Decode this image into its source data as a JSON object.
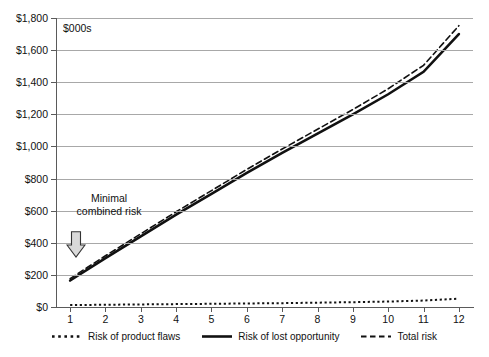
{
  "chart_data": {
    "type": "line",
    "title": "",
    "units_note": "$000s",
    "xlabel": "",
    "ylabel": "",
    "x": [
      1,
      2,
      3,
      4,
      5,
      6,
      7,
      8,
      9,
      10,
      11,
      12
    ],
    "xlim": [
      0.6,
      12.4
    ],
    "ylim": [
      0,
      1800
    ],
    "ytick_values": [
      0,
      200,
      400,
      600,
      800,
      1000,
      1200,
      1400,
      1600,
      1800
    ],
    "ytick_labels": [
      "$0",
      "$200",
      "$400",
      "$600",
      "$800",
      "$1,000",
      "$1,200",
      "$1,400",
      "$1,600",
      "$1,800"
    ],
    "xtick_labels": [
      "1",
      "2",
      "3",
      "4",
      "5",
      "6",
      "7",
      "8",
      "9",
      "10",
      "11",
      "12"
    ],
    "grid": true,
    "legend_position": "bottom",
    "series": [
      {
        "name": "Risk of product flaws",
        "style": "dotted",
        "color": "#111111",
        "values": [
          12,
          14,
          16,
          18,
          20,
          22,
          24,
          27,
          30,
          34,
          40,
          52
        ]
      },
      {
        "name": "Risk of lost opportunity",
        "style": "solid",
        "color": "#111111",
        "values": [
          165,
          305,
          440,
          575,
          705,
          835,
          960,
          1080,
          1200,
          1325,
          1465,
          1700
        ]
      },
      {
        "name": "Total risk",
        "style": "dashed",
        "color": "#111111",
        "values": [
          177,
          319,
          456,
          593,
          725,
          857,
          984,
          1107,
          1230,
          1359,
          1505,
          1752
        ]
      }
    ],
    "annotations": [
      {
        "text_line1": "Minimal",
        "text_line2": "combined risk",
        "arrow": "down-block-arrow",
        "arrow_fill": "#d9d9d9",
        "arrow_stroke": "#333333",
        "at_x": 1,
        "at_y": 400
      }
    ]
  },
  "legend": {
    "items": [
      {
        "label": "Risk of product flaws",
        "marker": "dotted-line-swatch"
      },
      {
        "label": "Risk of lost opportunity",
        "marker": "solid-line-swatch"
      },
      {
        "label": "Total risk",
        "marker": "dashed-line-swatch"
      }
    ]
  }
}
